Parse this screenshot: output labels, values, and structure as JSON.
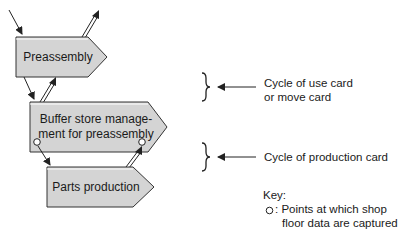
{
  "diagram": {
    "nodes": [
      {
        "id": "preassembly",
        "label": "Preassembly"
      },
      {
        "id": "buffer",
        "label_line1": "Buffer store manage-",
        "label_line2": "ment for preassembly"
      },
      {
        "id": "parts",
        "label": "Parts production"
      }
    ],
    "annotations": [
      {
        "id": "use-card",
        "line1": "Cycle of use card",
        "line2": "or move card"
      },
      {
        "id": "production-card",
        "line1": "Cycle of production card"
      }
    ],
    "key": {
      "title": "Key:",
      "symbol": "O",
      "line1": ": Points at which shop",
      "line2": "floor data are captured"
    },
    "colors": {
      "box_fill": "#d4d4d4",
      "box_stroke": "#333333",
      "line": "#222222"
    }
  }
}
